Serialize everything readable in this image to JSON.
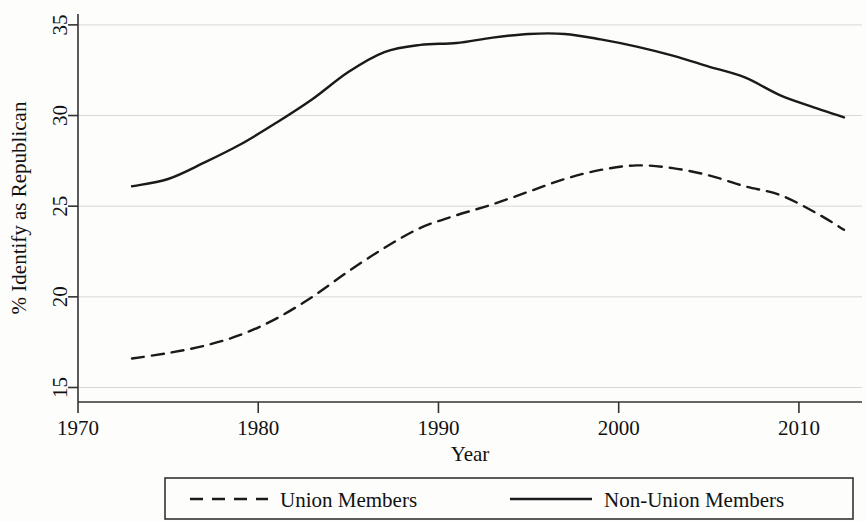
{
  "chart_data": {
    "type": "line",
    "title": "",
    "xlabel": "Year",
    "ylabel": "% Identify as Republican",
    "xlim": [
      1970,
      2013.5
    ],
    "ylim": [
      14.2,
      35.6
    ],
    "xticks": [
      1970,
      1980,
      1990,
      2000,
      2010
    ],
    "xtick_labels": [
      "1970",
      "1980",
      "1990",
      "2000",
      "2010"
    ],
    "yticks": [
      15,
      20,
      25,
      30,
      35
    ],
    "ytick_labels": [
      "15",
      "20",
      "25",
      "30",
      "35"
    ],
    "grid": "horizontal",
    "legend_position": "below",
    "series": [
      {
        "name": "Union Members",
        "style": "dashed",
        "color": "#1a1a1a",
        "x": [
          1973,
          1975,
          1977,
          1979,
          1981,
          1983,
          1985,
          1987,
          1989,
          1991,
          1993,
          1995,
          1997,
          1999,
          2001,
          2003,
          2005,
          2007,
          2009,
          2011,
          2012.5
        ],
        "values": [
          16.6,
          16.9,
          17.3,
          17.9,
          18.8,
          20.0,
          21.4,
          22.7,
          23.8,
          24.5,
          25.1,
          25.8,
          26.5,
          27.0,
          27.25,
          27.1,
          26.7,
          26.1,
          25.6,
          24.6,
          23.7
        ]
      },
      {
        "name": "Non-Union Members",
        "style": "solid",
        "color": "#1a1a1a",
        "x": [
          1973,
          1975,
          1977,
          1979,
          1981,
          1983,
          1985,
          1987,
          1989,
          1991,
          1993,
          1995,
          1997,
          1999,
          2001,
          2003,
          2005,
          2007,
          2009,
          2011,
          2012.5
        ],
        "values": [
          26.1,
          26.5,
          27.4,
          28.4,
          29.6,
          30.9,
          32.4,
          33.5,
          33.9,
          34.0,
          34.3,
          34.5,
          34.5,
          34.2,
          33.8,
          33.3,
          32.7,
          32.1,
          31.1,
          30.4,
          29.9
        ]
      }
    ],
    "legend_entries": [
      {
        "label": "Union Members",
        "style": "dashed"
      },
      {
        "label": "Non-Union Members",
        "style": "solid"
      }
    ]
  }
}
